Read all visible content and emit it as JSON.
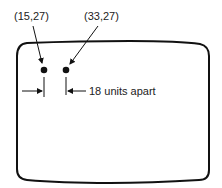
{
  "diagram": {
    "points": [
      {
        "label": "(15,27)",
        "x": 15,
        "y": 27
      },
      {
        "label": "(33,27)",
        "x": 33,
        "y": 27
      }
    ],
    "distance_label": "18 units apart",
    "colors": {
      "ink": "#111111",
      "background": "#ffffff"
    }
  }
}
